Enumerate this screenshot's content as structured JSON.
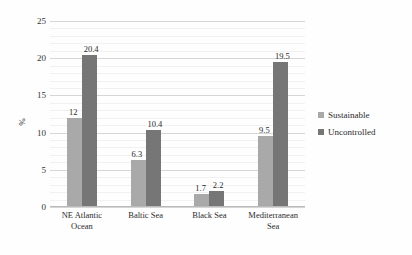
{
  "chart_data": {
    "type": "bar",
    "title": "",
    "subtitle": "",
    "xlabel": "",
    "ylabel": "%",
    "ylim": [
      0,
      25
    ],
    "ytick_values": [
      0,
      5,
      10,
      15,
      20,
      25
    ],
    "ytick_labels": [
      "0",
      "5",
      "10",
      "15",
      "20",
      "25"
    ],
    "minor_gridlines": true,
    "grid": true,
    "legend_position": "right",
    "categories": [
      "NE Atlantic Ocean",
      "Baltic Sea",
      "Black Sea",
      "Mediterranean Sea"
    ],
    "series": [
      {
        "name": "Sustainable",
        "color": "#a9a9a9",
        "values": [
          12,
          6.3,
          1.7,
          9.5
        ],
        "labels": [
          "12",
          "6.3",
          "1.7",
          "9.5"
        ]
      },
      {
        "name": "Uncontrolled",
        "color": "#767676",
        "values": [
          20.4,
          10.4,
          2.2,
          19.5
        ],
        "labels": [
          "20.4",
          "10.4",
          "2.2",
          "19.5"
        ]
      }
    ]
  },
  "legend": {
    "items": [
      {
        "label": "Sustainable",
        "color": "#a9a9a9"
      },
      {
        "label": "Uncontrolled",
        "color": "#767676"
      }
    ]
  },
  "axes": {
    "y_title": "%"
  },
  "colors": {
    "background": "#fefefe",
    "gridline": "#d6d6d6",
    "gridline_minor": "#f1f1f1",
    "axis": "#b9b9b9",
    "text": "#2b2b2b"
  }
}
